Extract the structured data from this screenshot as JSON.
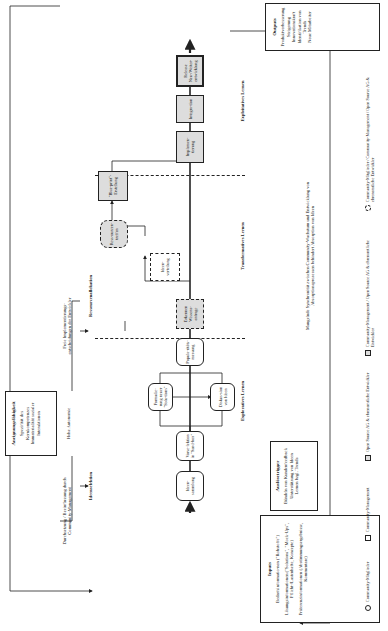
{
  "inputs": {
    "title": "Inputs",
    "lines": [
      "Bedarfsinformatio-nen (\"Rohstoffe\")",
      "Lösungsinformationen (\"Solutions\", \"Mock-Ups\", Pflicht-/Lastenhefte, Konzepte)",
      "Präferenzinformationen (Abstimmungsergebnisse, Kommentare)"
    ]
  },
  "outputs": {
    "title": "Outputs",
    "lines": [
      "Produktverbesserung",
      "Steigerung",
      "Innovationskraft",
      "Identifikation von",
      "Trends",
      "Neue Mitarbeiter"
    ]
  },
  "capability": {
    "title": "Aneignungsfähigkeit",
    "lines": [
      "Spezifität des Kernkompetenzes",
      "Immaterialität sozialer Interaktionen"
    ]
  },
  "trigger": {
    "title": "Auslösetrigger",
    "lines": [
      "Bündeln von Kundenfeedback",
      "Unterstützung von Ideen",
      "Lernen bzgl. Trends"
    ]
  },
  "nodes": [
    {
      "id": "ideensammlung",
      "label": "Ideen-sammlung",
      "type": "round"
    },
    {
      "id": "vorselektion",
      "label": "Vorse-lektion in \"Sand-box\"",
      "type": "round"
    },
    {
      "id": "formulierung",
      "label": "Formulie-rung neuer \"Solu-tions\"",
      "type": "round"
    },
    {
      "id": "diskussion",
      "label": "Diskus-sion von Ideen",
      "type": "round"
    },
    {
      "id": "popularitaet",
      "label": "Popula-ritäts-messung",
      "type": "round"
    },
    {
      "id": "erkennen",
      "label": "Erkennen Wissens-anfrage",
      "type": "dashsq"
    },
    {
      "id": "ideenverteilung",
      "label": "Ideen-verteilung",
      "type": "dash"
    },
    {
      "id": "ressourcen",
      "label": "Ress-ourcen-treffen",
      "type": "dashround"
    },
    {
      "id": "blueprint",
      "label": "\"Blue-print\"-Erstellung",
      "type": "sq"
    },
    {
      "id": "implementierung",
      "label": "Implemen-tierung",
      "type": "sq"
    },
    {
      "id": "integration",
      "label": "Integra-tion",
      "type": "sq"
    },
    {
      "id": "release",
      "label": "Release Neu-/Weiter-entwicklung",
      "type": "sq"
    }
  ],
  "phases": {
    "explorative": "Exploratives Lernen",
    "transformative": "Transformatives Lernen",
    "exploitative": "Exploitatives Lernen"
  },
  "annotations": {
    "ideenselektion": "Ideenselektion",
    "ressourcenallokation": "Ressourcenallokation",
    "left_note": "Durchsetzung / Beeinflussung durch Community-Management",
    "hohe_autonomie": "Hohe Autonomie",
    "right_note": "Freie Implementierungs-entscheidungen der Entwickler",
    "bottom_note": "Mangelnde Synchronität zwischen Community-Wachstum und Entwicklung von Absorptionsprozessen behindert Absorption von Ideen"
  },
  "legend": [
    {
      "symbol": "circle",
      "label": "Community-Mitglieder"
    },
    {
      "symbol": "dashed-square",
      "label": "Community-Management"
    },
    {
      "symbol": "gray-square",
      "label": "Open Source AG & ehrenamtliche Entwickler"
    },
    {
      "symbol": "dashed-gray-square",
      "label": "Community-Management / Open Source AG & ehrenamtliche Entwickler"
    },
    {
      "symbol": "dashed-circle",
      "label": "Community-Mitglieder / Community-Management / Open Source AG & ehrenamtliche Entwickler"
    }
  ]
}
